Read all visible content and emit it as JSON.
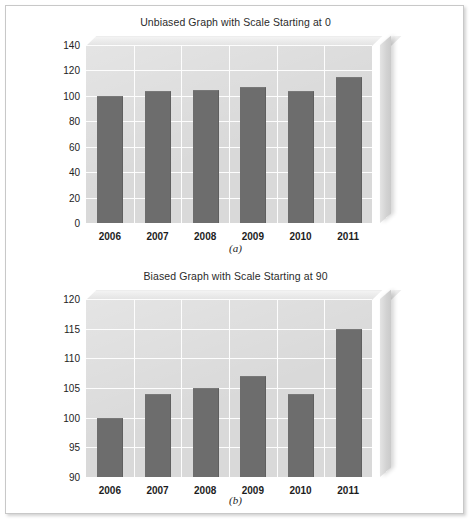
{
  "figures": [
    {
      "key": "a",
      "caption": "(a)",
      "chart_data": {
        "type": "bar",
        "title": "Unbiased Graph with Scale Starting at 0",
        "categories": [
          "2006",
          "2007",
          "2008",
          "2009",
          "2010",
          "2011"
        ],
        "values": [
          100,
          104,
          105,
          107,
          104,
          115
        ],
        "xlabel": "",
        "ylabel": "",
        "ylim": [
          0,
          140
        ],
        "yticks": [
          0,
          20,
          40,
          60,
          80,
          100,
          120,
          140
        ],
        "ytick_labels": [
          "0",
          "20",
          "40",
          "60",
          "80",
          "100",
          "120",
          "140"
        ],
        "grid": true,
        "legend": "none",
        "bar_color": "#6d6d6d",
        "plot_bg": "#d9d9d9"
      }
    },
    {
      "key": "b",
      "caption": "(b)",
      "chart_data": {
        "type": "bar",
        "title": "Biased Graph with Scale Starting at 90",
        "categories": [
          "2006",
          "2007",
          "2008",
          "2009",
          "2010",
          "2011"
        ],
        "values": [
          100,
          104,
          105,
          107,
          104,
          115
        ],
        "xlabel": "",
        "ylabel": "",
        "ylim": [
          90,
          120
        ],
        "yticks": [
          90,
          95,
          100,
          105,
          110,
          115,
          120
        ],
        "ytick_labels": [
          "90",
          "95",
          "100",
          "105",
          "110",
          "115",
          "120"
        ],
        "grid": true,
        "legend": "none",
        "bar_color": "#6d6d6d",
        "plot_bg": "#d9d9d9"
      }
    }
  ]
}
